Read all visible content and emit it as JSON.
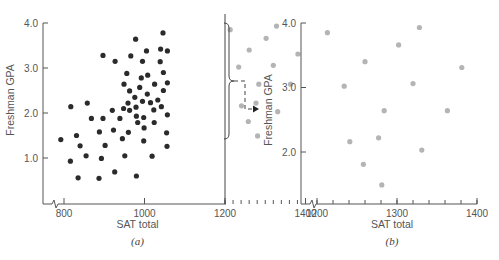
{
  "chart_data": [
    {
      "id": "a",
      "type": "scatter",
      "panel_label": "(a)",
      "xlabel": "SAT total",
      "ylabel": "Freshman GPA",
      "xlim": [
        780,
        1400
      ],
      "ylim": [
        0,
        4.0
      ],
      "x_ticks": [
        800,
        1000,
        1200,
        1400
      ],
      "x_tick_labels": [
        "800",
        "1000",
        "1200",
        "1400"
      ],
      "y_ticks": [
        1.0,
        2.0,
        3.0,
        4.0
      ],
      "y_tick_labels": [
        "1.0",
        "2.0",
        "3.0",
        "4.0"
      ],
      "minor_x_ticks_range": [
        1200,
        1400,
        20
      ],
      "axis_break": true,
      "divider_x": 1200,
      "grid": false,
      "series": [
        {
          "name": "SAT below 1200",
          "color": "#2b2b2b",
          "points": [
            [
              792,
              1.41
            ],
            [
              817,
              2.14
            ],
            [
              858,
              2.22
            ],
            [
              816,
              0.93
            ],
            [
              835,
              0.56
            ],
            [
              831,
              1.5
            ],
            [
              840,
              1.27
            ],
            [
              855,
              1.05
            ],
            [
              868,
              1.88
            ],
            [
              888,
              1.58
            ],
            [
              893,
              0.99
            ],
            [
              897,
              1.88
            ],
            [
              902,
              1.28
            ],
            [
              887,
              0.55
            ],
            [
              897,
              3.28
            ],
            [
              927,
              3.15
            ],
            [
              920,
              2.06
            ],
            [
              923,
              1.62
            ],
            [
              926,
              0.69
            ],
            [
              939,
              1.88
            ],
            [
              945,
              1.43
            ],
            [
              948,
              2.1
            ],
            [
              951,
              1.05
            ],
            [
              949,
              2.64
            ],
            [
              956,
              2.88
            ],
            [
              959,
              2.22
            ],
            [
              960,
              1.57
            ],
            [
              963,
              2.49
            ],
            [
              963,
              2.06
            ],
            [
              966,
              3.27
            ],
            [
              976,
              2.35
            ],
            [
              978,
              3.64
            ],
            [
              979,
              2.13
            ],
            [
              980,
              1.93
            ],
            [
              980,
              0.6
            ],
            [
              983,
              1.79
            ],
            [
              988,
              2.57
            ],
            [
              992,
              2.78
            ],
            [
              995,
              2.26
            ],
            [
              998,
              1.9
            ],
            [
              999,
              1.67
            ],
            [
              995,
              3.15
            ],
            [
              998,
              1.38
            ],
            [
              1005,
              3.38
            ],
            [
              1008,
              2.84
            ],
            [
              1007,
              2.42
            ],
            [
              1015,
              2.23
            ],
            [
              1023,
              2.07
            ],
            [
              1025,
              2.64
            ],
            [
              1024,
              1.79
            ],
            [
              1019,
              1.04
            ],
            [
              1033,
              2.29
            ],
            [
              1039,
              3.14
            ],
            [
              1042,
              2.14
            ],
            [
              1040,
              3.42
            ],
            [
              1046,
              3.78
            ],
            [
              1047,
              2.5
            ],
            [
              1047,
              2.9
            ],
            [
              1057,
              3.38
            ],
            [
              1057,
              2.67
            ],
            [
              1057,
              1.96
            ],
            [
              1055,
              1.56
            ],
            [
              1056,
              1.26
            ]
          ]
        },
        {
          "name": "SAT 1200 and above",
          "color": "#b4b4b4",
          "points": [
            [
              1213,
              3.85
            ],
            [
              1328,
              3.93
            ],
            [
              1302,
              3.66
            ],
            [
              1260,
              3.4
            ],
            [
              1381,
              3.31
            ],
            [
              1234,
              3.02
            ],
            [
              1320,
              3.06
            ],
            [
              1284,
              2.64
            ],
            [
              1363,
              2.64
            ],
            [
              1241,
              2.16
            ],
            [
              1277,
              2.22
            ],
            [
              1331,
              2.03
            ],
            [
              1258,
              1.81
            ],
            [
              1281,
              1.49
            ]
          ]
        }
      ],
      "annotations": [
        "brace grouping the SAT ≥ 1200 points with a dashed arrow pointing to panel (b)"
      ]
    },
    {
      "id": "b",
      "type": "scatter",
      "panel_label": "(b)",
      "xlabel": "SAT total",
      "ylabel": "Freshman GPA",
      "xlim": [
        1180,
        1400
      ],
      "ylim": [
        1.25,
        4.0
      ],
      "x_ticks": [
        1200,
        1300,
        1400
      ],
      "x_tick_labels": [
        "1200",
        "1300",
        "1400"
      ],
      "y_ticks": [
        2.0,
        3.0,
        4.0
      ],
      "y_tick_labels": [
        "2.0",
        "3.0",
        "4.0"
      ],
      "minor_x_ticks_range": [
        1200,
        1400,
        20
      ],
      "axis_break": true,
      "grid": false,
      "series": [
        {
          "name": "SAT 1200 and above",
          "color": "#b4b4b4",
          "points": [
            [
              1213,
              3.85
            ],
            [
              1328,
              3.93
            ],
            [
              1302,
              3.66
            ],
            [
              1260,
              3.4
            ],
            [
              1381,
              3.31
            ],
            [
              1234,
              3.02
            ],
            [
              1320,
              3.06
            ],
            [
              1284,
              2.64
            ],
            [
              1363,
              2.64
            ],
            [
              1241,
              2.16
            ],
            [
              1277,
              2.22
            ],
            [
              1331,
              2.03
            ],
            [
              1258,
              1.81
            ],
            [
              1281,
              1.49
            ]
          ]
        }
      ]
    }
  ]
}
